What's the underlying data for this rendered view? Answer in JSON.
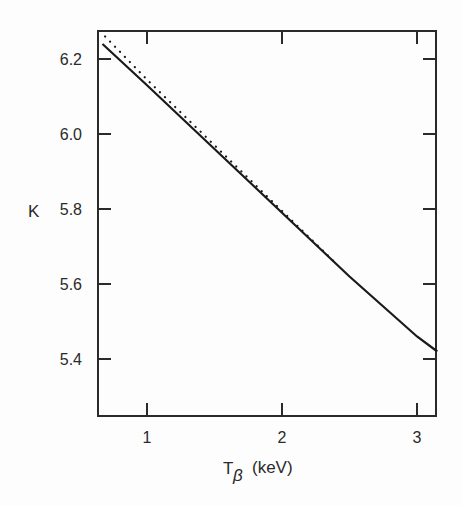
{
  "chart_data": {
    "type": "line",
    "title": "",
    "xlabel": "T_β (keV)",
    "xlabel_main": "T",
    "xlabel_sub": "β",
    "xlabel_unit": "(keV)",
    "ylabel": "K",
    "xlim": [
      0.63,
      3.15
    ],
    "ylim": [
      5.24,
      6.31
    ],
    "x_ticks": [
      1,
      2,
      3
    ],
    "x_tick_labels": [
      "1",
      "2",
      "3"
    ],
    "y_ticks": [
      5.4,
      5.6,
      5.8,
      6.0,
      6.2
    ],
    "y_tick_labels": [
      "5.4",
      "5.6",
      "5.8",
      "6.0",
      "6.2"
    ],
    "grid": false,
    "legend": null,
    "series": [
      {
        "name": "solid",
        "style": "solid",
        "x": [
          0.67,
          1.0,
          1.5,
          2.0,
          2.5,
          3.0,
          3.15
        ],
        "y": [
          6.24,
          6.13,
          5.96,
          5.79,
          5.62,
          5.46,
          5.42
        ]
      },
      {
        "name": "dotted",
        "style": "dotted",
        "x": [
          0.69,
          1.0,
          1.5,
          2.0,
          2.4
        ],
        "y": [
          6.26,
          6.145,
          5.97,
          5.795,
          5.655
        ]
      }
    ]
  },
  "labels": {
    "y_axis": "K",
    "x_axis_main": "T",
    "x_axis_sub": "β",
    "x_axis_unit": "(keV)",
    "x_ticks": [
      "1",
      "2",
      "3"
    ],
    "y_ticks": [
      "6.2",
      "6.0",
      "5.8",
      "5.6",
      "5.4"
    ]
  }
}
